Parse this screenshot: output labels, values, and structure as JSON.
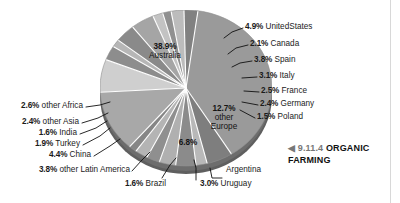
{
  "caption": {
    "arrow": "◀",
    "number": "9.11.4",
    "title": "ORGANIC",
    "title2": "FARMING"
  },
  "chart_data": {
    "type": "pie",
    "title": "9.11.4 ORGANIC FARMING",
    "units": "percent",
    "legend": "none",
    "value_label_suffix": "%",
    "categories": [
      "Australia",
      "United States",
      "Canada",
      "Spain",
      "Italy",
      "France",
      "Germany",
      "Poland",
      "other Europe",
      "Argentina",
      "Uruguay",
      "Brazil",
      "other Latin America",
      "China",
      "Turkey",
      "India",
      "other Asia",
      "other Africa"
    ],
    "values": [
      38.9,
      4.9,
      2.1,
      3.8,
      3.1,
      2.5,
      2.4,
      1.5,
      12.7,
      6.8,
      3.0,
      1.6,
      3.8,
      4.4,
      1.9,
      1.6,
      2.4,
      2.6
    ],
    "slices": [
      {
        "name": "Australia",
        "pct": "38.9%",
        "label": "Australia",
        "shade": "#9a9a9a"
      },
      {
        "name": "UnitedStates",
        "pct": "4.9%",
        "label": "UnitedStates",
        "shade": "#7e7e7e"
      },
      {
        "name": "Canada",
        "pct": "2.1%",
        "label": "Canada",
        "shade": "#b8b8b8"
      },
      {
        "name": "Spain",
        "pct": "3.8%",
        "label": "Spain",
        "shade": "#8b8b8b"
      },
      {
        "name": "Italy",
        "pct": "3.1%",
        "label": "Italy",
        "shade": "#b0b0b0"
      },
      {
        "name": "France",
        "pct": "2.5%",
        "label": "France",
        "shade": "#8f8f8f"
      },
      {
        "name": "Germany",
        "pct": "2.4%",
        "label": "Germany",
        "shade": "#b4b4b4"
      },
      {
        "name": "Poland",
        "pct": "1.5%",
        "label": "Poland",
        "shade": "#868686"
      },
      {
        "name": "other Europe",
        "pct": "12.7%",
        "label": "other Europe",
        "shade": "#a8a8a8"
      },
      {
        "name": "Argentina",
        "pct": "6.8%",
        "label": "Argentina",
        "shade": "#cfcfcf"
      },
      {
        "name": "Uruguay",
        "pct": "3.0%",
        "label": "Uruguay",
        "shade": "#8d8d8d"
      },
      {
        "name": "Brazil",
        "pct": "1.6%",
        "label": "Brazil",
        "shade": "#b6b6b6"
      },
      {
        "name": "other Latin America",
        "pct": "3.8%",
        "label": "other Latin America",
        "shade": "#8a8a8a"
      },
      {
        "name": "China",
        "pct": "4.4%",
        "label": "China",
        "shade": "#a5a5a5"
      },
      {
        "name": "Turkey",
        "pct": "1.9%",
        "label": "Turkey",
        "shade": "#c3c3c3"
      },
      {
        "name": "India",
        "pct": "1.6%",
        "label": "India",
        "shade": "#909090"
      },
      {
        "name": "other Asia",
        "pct": "2.4%",
        "label": "other Asia",
        "shade": "#bcbcbc"
      },
      {
        "name": "other Africa",
        "pct": "2.6%",
        "label": "other Africa",
        "shade": "#818181"
      }
    ]
  },
  "labels": {
    "australia": {
      "pct": "38.9%",
      "name": "Australia"
    },
    "other_europe": {
      "pct": "12.7%",
      "name": "other",
      "name2": "Europe"
    },
    "argentina_pct": {
      "pct": "6.8%",
      "name": "Argentina"
    },
    "united_states": {
      "pct": "4.9%",
      "name": "UnitedStates"
    },
    "canada": {
      "pct": "2.1%",
      "name": "Canada"
    },
    "spain": {
      "pct": "3.8%",
      "name": "Spain"
    },
    "italy": {
      "pct": "3.1%",
      "name": "Italy"
    },
    "france": {
      "pct": "2.5%",
      "name": "France"
    },
    "germany": {
      "pct": "2.4%",
      "name": "Germany"
    },
    "poland": {
      "pct": "1.5%",
      "name": "Poland"
    },
    "other_africa": {
      "pct": "2.6%",
      "name": "other Africa"
    },
    "other_asia": {
      "pct": "2.4%",
      "name": "other Asia"
    },
    "india": {
      "pct": "1.6%",
      "name": "India"
    },
    "turkey": {
      "pct": "1.9%",
      "name": "Turkey"
    },
    "china": {
      "pct": "4.4%",
      "name": "China"
    },
    "other_latin_america": {
      "pct": "3.8%",
      "name": "other Latin America"
    },
    "brazil": {
      "pct": "1.6%",
      "name": "Brazil"
    },
    "uruguay": {
      "pct": "3.0%",
      "name": "Uruguay"
    }
  },
  "colors": {
    "text": "#1b1b1b",
    "caption_gray": "#777777",
    "rim": "#5a5a5a",
    "divider": "#ffffff"
  }
}
